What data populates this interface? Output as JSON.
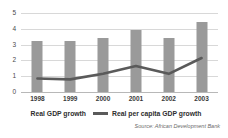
{
  "chart_data": {
    "type": "bar",
    "title": "",
    "subtitle": "",
    "xlabel": "",
    "ylabel": "",
    "categories": [
      "1998",
      "1999",
      "2000",
      "2001",
      "2002",
      "2003"
    ],
    "ylim": [
      0,
      5
    ],
    "yticks": [
      "5",
      "4",
      "3",
      "2",
      "1",
      "0"
    ],
    "ytick_values": [
      5,
      4,
      3,
      2,
      1,
      0
    ],
    "grid": true,
    "legend_position": "bottom",
    "series": [
      {
        "name": "Real GDP growth",
        "type": "bar",
        "color": "#9a9a9a",
        "values": [
          3.2,
          3.2,
          3.45,
          3.95,
          3.45,
          4.4
        ]
      },
      {
        "name": "Real per capita GDP growth",
        "type": "line",
        "color": "#5a5a5a",
        "values": [
          0.85,
          0.8,
          1.15,
          1.65,
          1.15,
          2.15
        ]
      }
    ],
    "source": "Source: African Development Bank"
  },
  "colors": {
    "bar": "#9a9a9a",
    "line": "#5a5a5a",
    "gridline": "#d8d8d8",
    "baseline": "#b8b8b8",
    "background": "#ffffff",
    "text": "#3a3a3a",
    "source_text": "#6a6a6a"
  }
}
